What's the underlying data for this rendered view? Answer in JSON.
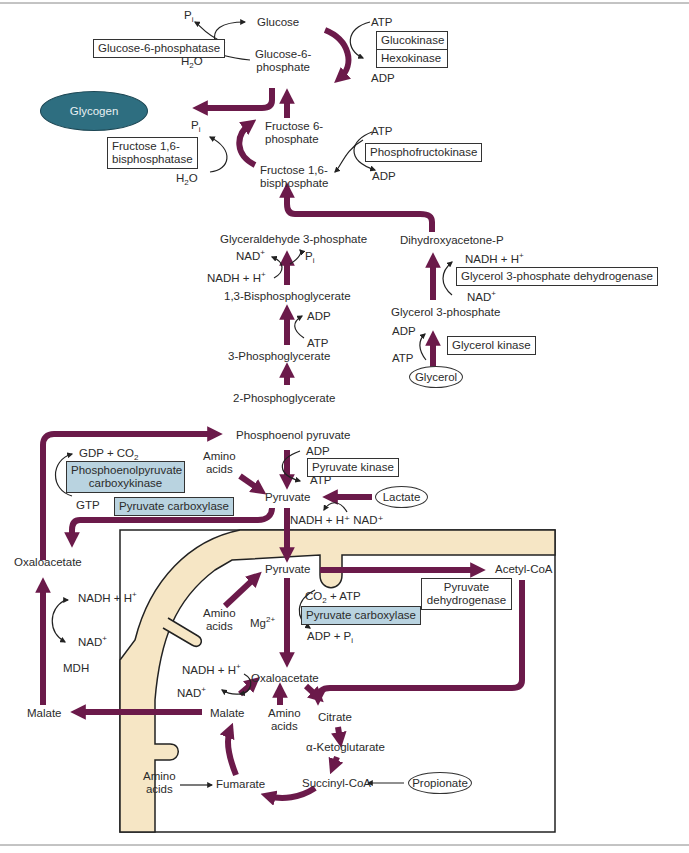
{
  "colors": {
    "arrow": "#6b1a4a",
    "membrane": "#f6e6c5",
    "enzyme_highlight": "#b9d3e0",
    "glycogen": "#2e6e80"
  },
  "metabolites": {
    "glucose": "Glucose",
    "g6p_1": "Glucose-6-",
    "g6p_2": "phosphate",
    "glycogen": "Glycogen",
    "f6p_1": "Fructose 6-",
    "f6p_2": "phosphate",
    "f16bp_1": "Fructose 1,6-",
    "f16bp_2": "bisphosphate",
    "g3p": "Glyceraldehyde 3-phosphate",
    "dhap": "Dihydroxyacetone-P",
    "bpg13": "1,3-Bisphosphoglycerate",
    "pg3": "3-Phosphoglycerate",
    "pg2": "2-Phosphoglycerate",
    "glycerol3p": "Glycerol 3-phosphate",
    "glycerol": "Glycerol",
    "pep": "Phosphoenol pyruvate",
    "pyruvate_cyto": "Pyruvate",
    "lactate": "Lactate",
    "oxaloacetate_cyto": "Oxaloacetate",
    "malate_cyto": "Malate",
    "pyruvate_mito": "Pyruvate",
    "acetyl_coa": "Acetyl-CoA",
    "oxaloacetate_mito": "Oxaloacetate",
    "malate_mito": "Malate",
    "citrate": "Citrate",
    "akg": "α-Ketoglutarate",
    "succinyl_coa": "Succinyl-CoA",
    "fumarate": "Fumarate",
    "propionate": "Propionate",
    "amino_acids_1": "Amino",
    "amino_acids_2": "acids"
  },
  "cofactors": {
    "pi": "P",
    "pi_sub": "i",
    "h2o": "H",
    "h2o_sub": "2",
    "h2o_tail": "O",
    "atp": "ATP",
    "adp": "ADP",
    "nad": "NAD",
    "nad_sup": "+",
    "nadh": "NADH + H",
    "nadh_sup": "+",
    "gdp_co2": "GDP + CO",
    "co2_sub": "2",
    "gtp": "GTP",
    "nadh_nad_pair": "NADH + H⁺ NAD⁺",
    "co2_atp": "CO",
    "co2_atp_tail": " + ATP",
    "mg": "Mg",
    "mg_sup": "2+",
    "adp_pi": "ADP + P",
    "mdh": "MDH"
  },
  "enzymes": {
    "g6pase": "Glucose-6-phosphatase",
    "glucokinase": "Glucokinase",
    "hexokinase": "Hexokinase",
    "fbpase_1": "Fructose 1,6-",
    "fbpase_2": "bisphosphatase",
    "pfk": "Phosphofructokinase",
    "g3pdh": "Glycerol 3-phosphate dehydrogenase",
    "glycerol_kinase": "Glycerol kinase",
    "pepck_1": "Phosphoenolpyruvate",
    "pepck_2": "carboxykinase",
    "pyruvate_carboxylase": "Pyruvate carboxylase",
    "pyruvate_kinase": "Pyruvate kinase",
    "pdh_1": "Pyruvate",
    "pdh_2": "dehydrogenase"
  }
}
